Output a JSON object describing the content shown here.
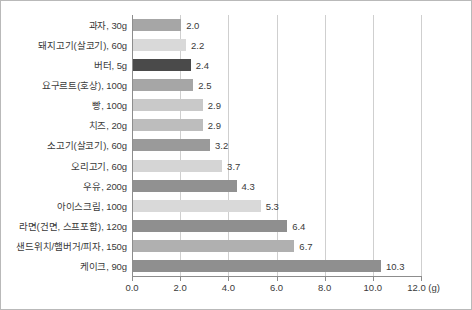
{
  "chart_data": {
    "type": "bar",
    "orientation": "horizontal",
    "title": "",
    "subtitle": "",
    "xlabel": "(g)",
    "ylabel": "",
    "xlim": [
      0.0,
      12.0
    ],
    "grid": true,
    "legend": "none",
    "xticks": [
      "0.0",
      "2.0",
      "4.0",
      "6.0",
      "8.0",
      "10.0",
      "12.0"
    ],
    "xtick_values": [
      0.0,
      2.0,
      4.0,
      6.0,
      8.0,
      10.0,
      12.0
    ],
    "unit_suffix": "(g)",
    "categories": [
      "과자, 30g",
      "돼지고기(살코기), 60g",
      "버터, 5g",
      "요구르트(호상), 100g",
      "빵, 100g",
      "치즈, 20g",
      "소고기(살코기), 60g",
      "오리고기, 60g",
      "우유, 200g",
      "아이스크림, 100g",
      "라면(건면, 스프포함), 120g",
      "샌드위치/햄버거/피자, 150g",
      "케이크, 90g"
    ],
    "values": [
      2.0,
      2.2,
      2.4,
      2.5,
      2.9,
      2.9,
      3.2,
      3.7,
      4.3,
      5.3,
      6.4,
      6.7,
      10.3
    ],
    "value_labels": [
      "2.0",
      "2.2",
      "2.4",
      "2.5",
      "2.9",
      "2.9",
      "3.2",
      "3.7",
      "4.3",
      "5.3",
      "6.4",
      "6.7",
      "10.3"
    ],
    "bar_colors": [
      "#a6a6a6",
      "#d9d9d9",
      "#4a4a4a",
      "#a6a6a6",
      "#c9c9c9",
      "#bdbdbd",
      "#9a9a9a",
      "#d5d5d5",
      "#919191",
      "#d9d9d9",
      "#8f8f8f",
      "#b0b0b0",
      "#8f8f8f"
    ],
    "colors": {
      "axis": "#8d8d8d",
      "grid": "#cfcfcf",
      "text": "#3a3a3a",
      "border": "#b9b9b9",
      "background": "#ffffff",
      "highlight": "#4a4a4a"
    }
  }
}
